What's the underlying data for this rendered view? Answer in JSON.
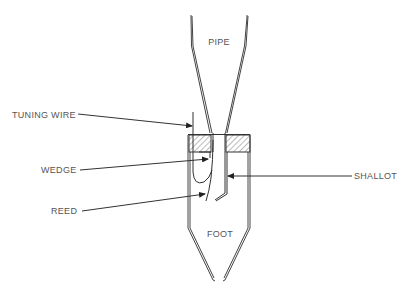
{
  "diagram": {
    "labels": {
      "pipe": "PIPE",
      "foot": "FOOT",
      "tuning_wire": "TUNING WIRE",
      "wedge": "WEDGE",
      "reed": "REED",
      "shallot": "SHALLOT"
    }
  },
  "colors": {
    "line": "#333333",
    "text": "#555555",
    "background": "#ffffff"
  }
}
